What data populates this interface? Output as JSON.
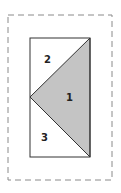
{
  "diagram": {
    "regions": [
      {
        "id": "1",
        "label": "1",
        "fill": "#c4c4c4",
        "description": "shaded triangle"
      },
      {
        "id": "2",
        "label": "2",
        "fill": "#ffffff",
        "description": "upper-left triangle"
      },
      {
        "id": "3",
        "label": "3",
        "fill": "#ffffff",
        "description": "lower-left triangle"
      }
    ],
    "outer_border": {
      "style": "dashed",
      "color": "#8a8a8a"
    },
    "rectangle": {
      "stroke": "#333333"
    }
  }
}
